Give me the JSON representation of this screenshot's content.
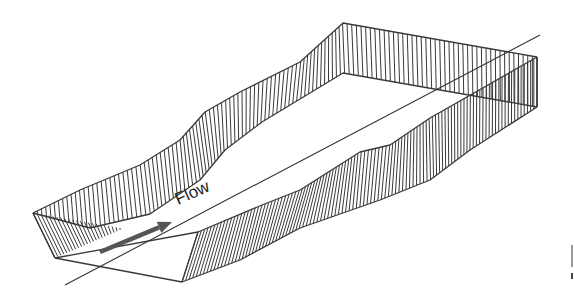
{
  "figure": {
    "title": "",
    "flow_label": "Flow",
    "colors": {
      "line": "#3a3a3a",
      "arrow": "#555555",
      "background": "#ffffff"
    }
  },
  "geometry": {
    "back_wall_top": [
      [
        33,
        213
      ],
      [
        80,
        190
      ],
      [
        140,
        165
      ],
      [
        180,
        140
      ],
      [
        205,
        112
      ],
      [
        240,
        92
      ],
      [
        300,
        62
      ],
      [
        343,
        23
      ],
      [
        537,
        57
      ]
    ],
    "back_wall_bottom": [
      [
        33,
        213
      ],
      [
        90,
        228
      ],
      [
        150,
        214
      ],
      [
        200,
        180
      ],
      [
        225,
        150
      ],
      [
        262,
        122
      ],
      [
        343,
        73
      ],
      [
        537,
        107
      ]
    ],
    "near_wall_top": [
      [
        198,
        232
      ],
      [
        262,
        205
      ],
      [
        300,
        190
      ],
      [
        360,
        152
      ],
      [
        390,
        145
      ],
      [
        430,
        118
      ],
      [
        537,
        57
      ]
    ],
    "near_wall_bottom": [
      [
        182,
        282
      ],
      [
        240,
        260
      ],
      [
        300,
        228
      ],
      [
        380,
        200
      ],
      [
        430,
        180
      ],
      [
        470,
        150
      ],
      [
        537,
        107
      ]
    ],
    "floor_front": [
      [
        55,
        258
      ],
      [
        182,
        282
      ]
    ],
    "left_face": [
      [
        33,
        213
      ],
      [
        55,
        258
      ]
    ],
    "near_front_edge": [
      [
        182,
        282
      ],
      [
        198,
        232
      ]
    ],
    "floor_top_edge": [
      [
        55,
        258
      ],
      [
        198,
        232
      ]
    ],
    "axis_line": [
      [
        65,
        285
      ],
      [
        540,
        35
      ]
    ],
    "flow_arrow": {
      "from": [
        100,
        252
      ],
      "to": [
        172,
        222
      ]
    },
    "flow_label_pos": [
      178,
      205
    ],
    "flow_label_angle": -24
  }
}
